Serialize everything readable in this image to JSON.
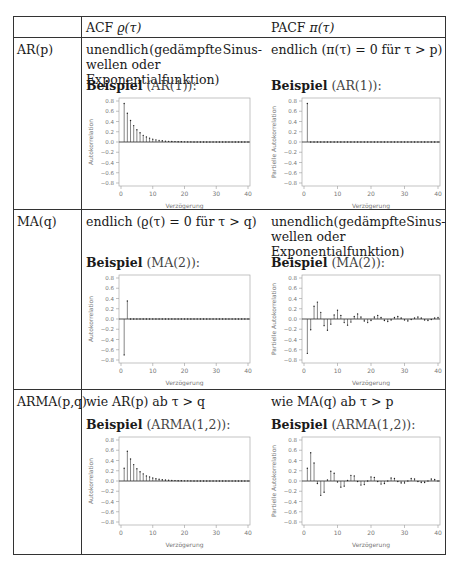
{
  "header": {
    "acf_label": "ACF",
    "acf_symbol": "ϱ(τ)",
    "pacf_label": "PACF",
    "pacf_symbol": "π(τ)"
  },
  "rows": [
    {
      "model": "AR(p)",
      "acf_desc_line1_a": "unendlich",
      "acf_desc_line1_b": "(gedämpfte",
      "acf_desc_line1_c": "Sinus-",
      "acf_desc_line2": "wellen oder Exponentialfunktion)",
      "pacf_desc_line1": "endlich (π(τ) = 0 für τ > p)",
      "acf_example_bold": "Beispiel",
      "acf_example_paren": "(AR(1)):",
      "pacf_example_bold": "Beispiel",
      "pacf_example_paren": "(AR(1)):"
    },
    {
      "model": "MA(q)",
      "acf_desc_line1": "endlich (ϱ(τ) = 0 für τ > q)",
      "pacf_desc_line1_a": "unendlich",
      "pacf_desc_line1_b": "(gedämpfte",
      "pacf_desc_line1_c": "Sinus-",
      "pacf_desc_line2": "wellen oder Exponentialfunktion)",
      "acf_example_bold": "Beispiel",
      "acf_example_paren": "(MA(2)):",
      "pacf_example_bold": "Beispiel",
      "pacf_example_paren": "(MA(2)):"
    },
    {
      "model": "ARMA(p,q)",
      "acf_desc_line1": "wie AR(p) ab τ > q",
      "pacf_desc_line1": "wie MA(q) ab τ > p",
      "acf_example_bold": "Beispiel",
      "acf_example_paren": "(ARMA(1,2)):",
      "pacf_example_bold": "Beispiel",
      "pacf_example_paren": "(ARMA(1,2)):"
    }
  ],
  "axis": {
    "xlabel": "Verzögerung",
    "ylabel_acf": "Autokorrelation",
    "ylabel_pacf": "Partielle Autokorrelation",
    "yticks": [
      "0.8",
      "0.6",
      "0.4",
      "0.2",
      "0.0",
      "−0.2",
      "−0.4",
      "−0.6",
      "−0.8"
    ],
    "xticks": [
      "0",
      "10",
      "20",
      "30",
      "40"
    ]
  },
  "chart_data": [
    {
      "id": "ar1_acf",
      "type": "bar",
      "title": "Beispiel (AR(1))",
      "xlabel": "Verzögerung",
      "ylabel": "Autokorrelation",
      "xlim": [
        0,
        40
      ],
      "ylim": [
        -0.85,
        0.85
      ],
      "x": [
        1,
        2,
        3,
        4,
        5,
        6,
        7,
        8,
        9,
        10,
        11,
        12,
        13,
        14,
        15,
        16,
        17,
        18,
        19,
        20,
        21,
        22,
        23,
        24,
        25,
        26,
        27,
        28,
        29,
        30,
        31,
        32,
        33,
        34,
        35,
        36,
        37,
        38,
        39,
        40
      ],
      "values": [
        0.75,
        0.56,
        0.42,
        0.32,
        0.24,
        0.18,
        0.13,
        0.1,
        0.075,
        0.056,
        0.042,
        0.032,
        0.024,
        0.018,
        0.013,
        0.01,
        0.008,
        0.006,
        0.004,
        0.003,
        0.002,
        0.002,
        0.001,
        0.001,
        0.001,
        0,
        0,
        0,
        0,
        0,
        0,
        0,
        0,
        0,
        0,
        0,
        0,
        0,
        0,
        0
      ]
    },
    {
      "id": "ar1_pacf",
      "type": "bar",
      "title": "Beispiel (AR(1))",
      "xlabel": "Verzögerung",
      "ylabel": "Partielle Autokorrelation",
      "xlim": [
        0,
        40
      ],
      "ylim": [
        -0.85,
        0.85
      ],
      "x": [
        1,
        2,
        3,
        4,
        5,
        6,
        7,
        8,
        9,
        10,
        11,
        12,
        13,
        14,
        15,
        16,
        17,
        18,
        19,
        20,
        21,
        22,
        23,
        24,
        25,
        26,
        27,
        28,
        29,
        30,
        31,
        32,
        33,
        34,
        35,
        36,
        37,
        38,
        39,
        40
      ],
      "values": [
        0.75,
        0,
        0,
        0,
        0,
        0,
        0,
        0,
        0,
        0,
        0,
        0,
        0,
        0,
        0,
        0,
        0,
        0,
        0,
        0,
        0,
        0,
        0,
        0,
        0,
        0,
        0,
        0,
        0,
        0,
        0,
        0,
        0,
        0,
        0,
        0,
        0,
        0,
        0,
        0
      ]
    },
    {
      "id": "ma2_acf",
      "type": "bar",
      "title": "Beispiel (MA(2))",
      "xlabel": "Verzögerung",
      "ylabel": "Autokorrelation",
      "xlim": [
        0,
        40
      ],
      "ylim": [
        -0.85,
        0.85
      ],
      "x": [
        1,
        2,
        3,
        4,
        5,
        6,
        7,
        8,
        9,
        10,
        11,
        12,
        13,
        14,
        15,
        16,
        17,
        18,
        19,
        20,
        21,
        22,
        23,
        24,
        25,
        26,
        27,
        28,
        29,
        30,
        31,
        32,
        33,
        34,
        35,
        36,
        37,
        38,
        39,
        40
      ],
      "values": [
        -0.7,
        0.35,
        0,
        0,
        0,
        0,
        0,
        0,
        0,
        0,
        0,
        0,
        0,
        0,
        0,
        0,
        0,
        0,
        0,
        0,
        0,
        0,
        0,
        0,
        0,
        0,
        0,
        0,
        0,
        0,
        0,
        0,
        0,
        0,
        0,
        0,
        0,
        0,
        0,
        0
      ]
    },
    {
      "id": "ma2_pacf",
      "type": "bar",
      "title": "Beispiel (MA(2))",
      "xlabel": "Verzögerung",
      "ylabel": "Partielle Autokorrelation",
      "xlim": [
        0,
        40
      ],
      "ylim": [
        -0.85,
        0.85
      ],
      "x": [
        1,
        2,
        3,
        4,
        5,
        6,
        7,
        8,
        9,
        10,
        11,
        12,
        13,
        14,
        15,
        16,
        17,
        18,
        19,
        20,
        21,
        22,
        23,
        24,
        25,
        26,
        27,
        28,
        29,
        30,
        31,
        32,
        33,
        34,
        35,
        36,
        37,
        38,
        39,
        40
      ],
      "values": [
        -0.67,
        -0.21,
        0.25,
        0.33,
        0.13,
        -0.13,
        -0.22,
        -0.1,
        0.08,
        0.17,
        0.07,
        -0.07,
        -0.12,
        -0.06,
        0.05,
        0.1,
        0.04,
        -0.04,
        -0.07,
        -0.03,
        0.04,
        0.07,
        0.03,
        -0.03,
        -0.05,
        -0.02,
        0.03,
        0.05,
        0.02,
        -0.02,
        -0.04,
        -0.01,
        0.02,
        0.04,
        0.02,
        -0.02,
        -0.03,
        -0.01,
        0.02,
        0.03
      ]
    },
    {
      "id": "arma12_acf",
      "type": "bar",
      "title": "Beispiel (ARMA(1,2))",
      "xlabel": "Verzögerung",
      "ylabel": "Autokorrelation",
      "xlim": [
        0,
        40
      ],
      "ylim": [
        -0.85,
        0.85
      ],
      "x": [
        1,
        2,
        3,
        4,
        5,
        6,
        7,
        8,
        9,
        10,
        11,
        12,
        13,
        14,
        15,
        16,
        17,
        18,
        19,
        20,
        21,
        22,
        23,
        24,
        25,
        26,
        27,
        28,
        29,
        30,
        31,
        32,
        33,
        34,
        35,
        36,
        37,
        38,
        39,
        40
      ],
      "values": [
        0.25,
        0.58,
        0.43,
        0.32,
        0.24,
        0.18,
        0.14,
        0.1,
        0.08,
        0.06,
        0.045,
        0.034,
        0.025,
        0.019,
        0.014,
        0.011,
        0.008,
        0.006,
        0.005,
        0.003,
        0.003,
        0.002,
        0.001,
        0.001,
        0.001,
        0,
        0,
        0,
        0,
        0,
        0,
        0,
        0,
        0,
        0,
        0,
        0,
        0,
        0,
        0
      ]
    },
    {
      "id": "arma12_pacf",
      "type": "bar",
      "title": "Beispiel (ARMA(1,2))",
      "xlabel": "Verzögerung",
      "ylabel": "Partielle Autokorrelation",
      "xlim": [
        0,
        40
      ],
      "ylim": [
        -0.85,
        0.85
      ],
      "x": [
        1,
        2,
        3,
        4,
        5,
        6,
        7,
        8,
        9,
        10,
        11,
        12,
        13,
        14,
        15,
        16,
        17,
        18,
        19,
        20,
        21,
        22,
        23,
        24,
        25,
        26,
        27,
        28,
        29,
        30,
        31,
        32,
        33,
        34,
        35,
        36,
        37,
        38,
        39,
        40
      ],
      "values": [
        0.25,
        0.55,
        0.35,
        -0.05,
        -0.28,
        -0.22,
        0.02,
        0.19,
        0.15,
        -0.02,
        -0.12,
        -0.1,
        0.01,
        0.11,
        0.1,
        -0.01,
        -0.08,
        -0.07,
        0.0,
        0.08,
        0.07,
        -0.01,
        -0.06,
        -0.05,
        0.0,
        0.06,
        0.05,
        -0.01,
        -0.04,
        -0.04,
        0.0,
        0.05,
        0.04,
        -0.01,
        -0.03,
        -0.03,
        0.0,
        0.04,
        0.03,
        0.0
      ]
    }
  ]
}
